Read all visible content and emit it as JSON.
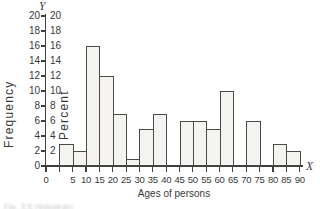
{
  "figure": {
    "y_axis_end_label": "Y",
    "x_axis_end_label": "X",
    "frequency_axis_label": "Frequency",
    "percent_axis_label": "Percent",
    "x_axis_label": "Ages of persons",
    "caption_fragment": "Fig. 3.5 Histogram"
  },
  "chart_data": {
    "type": "bar",
    "subtype": "histogram",
    "title": "",
    "xlabel": "Ages of persons",
    "ylabel": "Frequency",
    "ylabel_secondary": "Percent",
    "bin_width": 5,
    "categories": [
      "0-5",
      "5-10",
      "10-15",
      "15-20",
      "20-25",
      "25-30",
      "30-35",
      "35-40",
      "40-45",
      "45-50",
      "50-55",
      "55-60",
      "60-65",
      "65-70",
      "70-75",
      "75-80",
      "80-85",
      "85-90"
    ],
    "values": [
      3,
      2,
      16,
      12,
      7,
      1,
      5,
      7,
      0,
      6,
      6,
      5,
      10,
      0,
      6,
      0,
      3,
      2
    ],
    "x_tick_labels": [
      "0",
      "5",
      "10",
      "15",
      "20",
      "25",
      "30",
      "35",
      "40",
      "45",
      "50",
      "55",
      "60",
      "65",
      "70",
      "75",
      "80",
      "85",
      "90"
    ],
    "y_tick_labels_outer": [
      "0",
      "2",
      "4",
      "6",
      "8",
      "10",
      "12",
      "14",
      "16",
      "18",
      "20"
    ],
    "y_tick_labels_inner": [
      "2",
      "4",
      "6",
      "8",
      "10",
      "12",
      "14",
      "16",
      "18",
      "20"
    ],
    "xlim": [
      0,
      90
    ],
    "ylim": [
      0,
      20
    ],
    "y_tick_step": 2,
    "grid": false,
    "legend": "none"
  },
  "colors": {
    "background": "#ffffff",
    "text": "#383838",
    "axis": "#3f3f3f",
    "bar_fill": "#f4f3f0",
    "bar_border": "#4a4a4a",
    "caption": "#9a9a9a"
  }
}
